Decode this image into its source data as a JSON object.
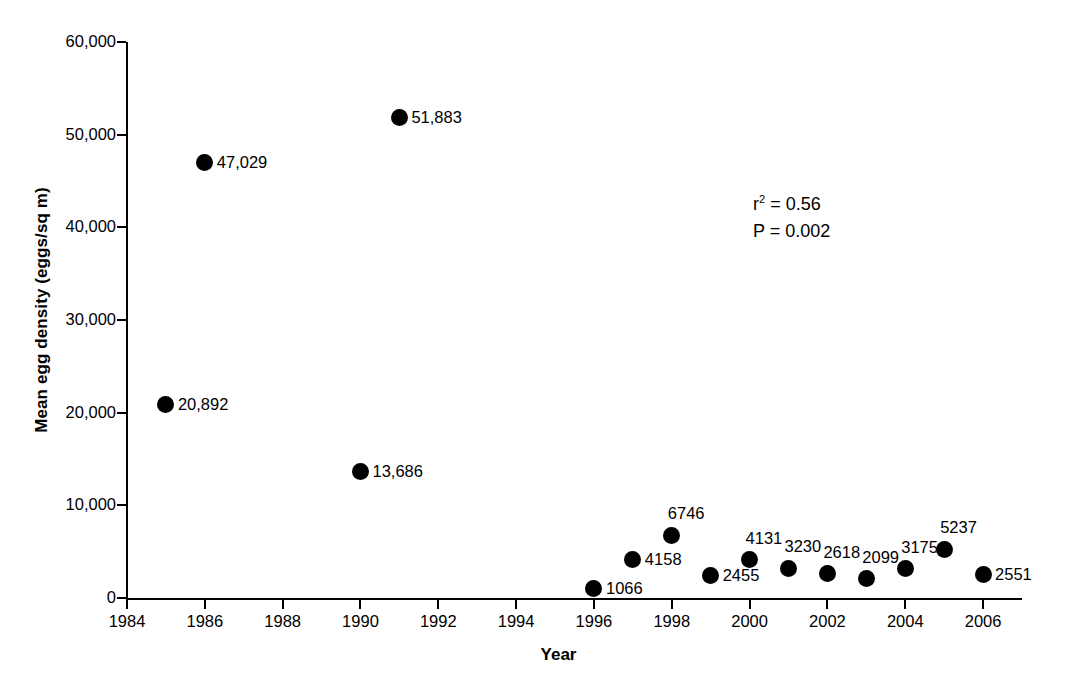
{
  "chart_data": {
    "type": "scatter",
    "title": "",
    "xlabel": "Year",
    "ylabel": "Mean egg density (eggs/sq m)",
    "xlim": [
      1984,
      2007
    ],
    "ylim": [
      0,
      60000
    ],
    "grid": false,
    "legend": null,
    "x": [
      1985,
      1986,
      1990,
      1991,
      1996,
      1997,
      1998,
      1999,
      2000,
      2001,
      2002,
      2003,
      2004,
      2005,
      2006
    ],
    "y": [
      20892,
      47029,
      13686,
      51883,
      1066,
      4158,
      6746,
      2455,
      4131,
      3230,
      2618,
      2099,
      3175,
      5237,
      2551
    ],
    "point_labels": [
      "20,892",
      "47,029",
      "13,686",
      "51,883",
      "1066",
      "4158",
      "6746",
      "2455",
      "4131",
      "3230",
      "2618",
      "2099",
      "3175",
      "5237",
      "2551"
    ],
    "xticks": [
      1984,
      1986,
      1988,
      1990,
      1992,
      1994,
      1996,
      1998,
      2000,
      2002,
      2004,
      2006
    ],
    "xtick_labels": [
      "1984",
      "1986",
      "1988",
      "1990",
      "1992",
      "1994",
      "1996",
      "1998",
      "2000",
      "2002",
      "2004",
      "2006"
    ],
    "yticks": [
      0,
      10000,
      20000,
      30000,
      40000,
      50000,
      60000
    ],
    "ytick_labels": [
      "0",
      "10,000",
      "20,000",
      "30,000",
      "40,000",
      "50,000",
      "60,000"
    ],
    "marker_color": "#000000",
    "annotations": [
      {
        "name": "r-squared",
        "text_prefix": "r",
        "text_sup": "2",
        "text_rest": " = 0.56"
      },
      {
        "name": "p-value",
        "text": "P = 0.002"
      }
    ]
  },
  "annotation_lines": {
    "r_squared_prefix": "r",
    "r_squared_sup": "2",
    "r_squared_rest": " = 0.56",
    "p_value": "P = 0.002"
  },
  "axes": {
    "x_title": "Year",
    "y_title": "Mean egg density (eggs/sq m)"
  }
}
